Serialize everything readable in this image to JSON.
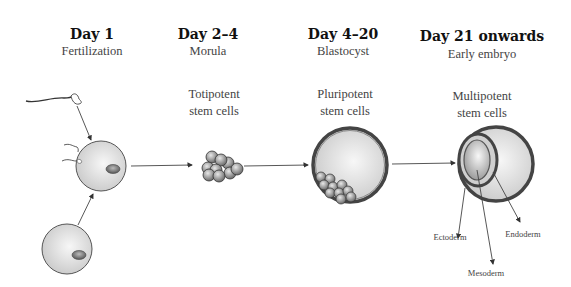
{
  "stages": [
    {
      "day": "Day 1",
      "name": "Fertilization",
      "cells": ""
    },
    {
      "day": "Day 2–4",
      "name": "Morula",
      "cells_line1": "Totipotent",
      "cells_line2": "stem cells"
    },
    {
      "day": "Day 4–20",
      "name": "Blastocyst",
      "cells_line1": "Pluripotent",
      "cells_line2": "stem cells"
    },
    {
      "day": "Day 21 onwards",
      "name": "Early embryo",
      "cells_line1": "Multipotent",
      "cells_line2": "stem cells"
    }
  ],
  "germ_layers": {
    "ectoderm": "Ectoderm",
    "mesoderm": "Mesoderm",
    "endoderm": "Endoderm"
  },
  "colors": {
    "cell_fill": "#dcdcdc",
    "outline": "#555555",
    "arrow": "#444444"
  }
}
